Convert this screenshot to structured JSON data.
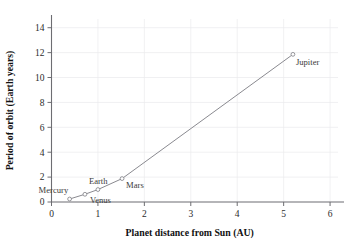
{
  "chart_data": {
    "type": "line",
    "title": "",
    "xlabel": "Planet distance from Sun (AU)",
    "ylabel": "Period of orbit (Earth years)",
    "xlim": [
      0,
      6.3
    ],
    "ylim": [
      0,
      14.7
    ],
    "grid": true,
    "legend": "none",
    "marker": "open-circle",
    "line_color": "#8a8a90",
    "grid_color": "#e9e9ec",
    "axis_color": "#6d6d72",
    "xticks": [
      "0",
      "1",
      "2",
      "3",
      "4",
      "5",
      "6"
    ],
    "xtick_values": [
      0,
      1,
      2,
      3,
      4,
      5,
      6
    ],
    "yticks": [
      "0",
      "2",
      "4",
      "6",
      "8",
      "10",
      "12",
      "14"
    ],
    "ytick_values": [
      0,
      2,
      4,
      6,
      8,
      10,
      12,
      14
    ],
    "points": [
      {
        "label": "Mercury",
        "x": 0.39,
        "y": 0.24,
        "label_dx": -31,
        "label_dy": -6,
        "anchor": "start"
      },
      {
        "label": "Venus",
        "x": 0.72,
        "y": 0.62,
        "label_dx": 5,
        "label_dy": 9,
        "anchor": "start"
      },
      {
        "label": "Earth",
        "x": 1.0,
        "y": 1.0,
        "label_dx": -9,
        "label_dy": -6,
        "anchor": "start"
      },
      {
        "label": "Mars",
        "x": 1.52,
        "y": 1.88,
        "label_dx": 4,
        "label_dy": 9,
        "anchor": "start"
      },
      {
        "label": "Jupiter",
        "x": 5.2,
        "y": 11.86,
        "label_dx": 3,
        "label_dy": 11,
        "anchor": "start"
      }
    ]
  }
}
